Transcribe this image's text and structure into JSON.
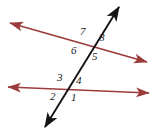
{
  "figure": {
    "kind": "geometry-diagram",
    "background_color": "#ffffff",
    "width": 155,
    "height": 134,
    "colors": {
      "parallel_line": "#9c3b3b",
      "transversal": "#141414",
      "label_text": "#1a1a1a"
    },
    "lines": [
      {
        "name": "upper-parallel-line",
        "color": "#9c3b3b",
        "arrowheads": "both",
        "x1": 10,
        "y1": 23,
        "x2": 147,
        "y2": 62
      },
      {
        "name": "lower-parallel-line",
        "color": "#9c3b3b",
        "arrowheads": "both",
        "x1": 8,
        "y1": 87,
        "x2": 149,
        "y2": 93
      },
      {
        "name": "transversal-line",
        "color": "#141414",
        "arrowheads": "both",
        "x1": 119,
        "y1": 7,
        "x2": 45,
        "y2": 127
      }
    ],
    "intersections": [
      {
        "name": "upper-intersection",
        "x": 88,
        "y": 42
      },
      {
        "name": "lower-intersection",
        "x": 70,
        "y": 88
      }
    ],
    "angle_labels": [
      {
        "id": "7",
        "text": "7",
        "x": 80,
        "y": 26,
        "at": "upper-intersection",
        "position": "upper-left"
      },
      {
        "id": "8",
        "text": "8",
        "x": 99,
        "y": 32,
        "at": "upper-intersection",
        "position": "upper-right"
      },
      {
        "id": "6",
        "text": "6",
        "x": 71,
        "y": 45,
        "at": "upper-intersection",
        "position": "lower-left"
      },
      {
        "id": "5",
        "text": "5",
        "x": 92,
        "y": 51,
        "at": "upper-intersection",
        "position": "lower-right"
      },
      {
        "id": "3",
        "text": "3",
        "x": 57,
        "y": 72,
        "at": "lower-intersection",
        "position": "upper-left"
      },
      {
        "id": "4",
        "text": "4",
        "x": 76,
        "y": 75,
        "at": "lower-intersection",
        "position": "upper-right"
      },
      {
        "id": "2",
        "text": "2",
        "x": 50,
        "y": 91,
        "at": "lower-intersection",
        "position": "lower-left"
      },
      {
        "id": "1",
        "text": "1",
        "x": 71,
        "y": 92,
        "at": "lower-intersection",
        "position": "lower-right"
      }
    ]
  }
}
